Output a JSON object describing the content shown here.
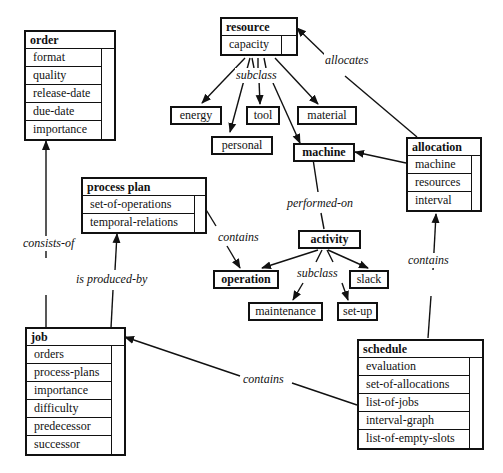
{
  "classes": {
    "order": {
      "title": "order",
      "attributes": [
        "format",
        "quality",
        "release-date",
        "due-date",
        "importance"
      ]
    },
    "resource": {
      "title": "resource",
      "attributes": [
        "capacity"
      ]
    },
    "allocation": {
      "title": "allocation",
      "attributes": [
        "machine",
        "resources",
        "interval"
      ]
    },
    "process_plan": {
      "title": "process plan",
      "attributes": [
        "set-of-operations",
        "temporal-relations"
      ]
    },
    "job": {
      "title": "job",
      "attributes": [
        "orders",
        "process-plans",
        "importance",
        "difficulty",
        "predecessor",
        "successor"
      ]
    },
    "schedule": {
      "title": "schedule",
      "attributes": [
        "evaluation",
        "set-of-allocations",
        "list-of-jobs",
        "interval-graph",
        "list-of-empty-slots"
      ]
    }
  },
  "nodes": {
    "energy": "energy",
    "tool": "tool",
    "material": "material",
    "personal": "personal",
    "machine": "machine",
    "activity": "activity",
    "operation": "operation",
    "slack": "slack",
    "maintenance": "maintenance",
    "set_up": "set-up"
  },
  "edge_labels": {
    "resource_subclass": "subclass",
    "allocates": "allocates",
    "performed_on": "performed-on",
    "activity_subclass": "subclass",
    "plan_contains": "contains",
    "consists_of": "consists-of",
    "is_produced_by": "is produced-by",
    "schedule_contains_jobs": "contains",
    "schedule_contains_allocations": "contains"
  }
}
